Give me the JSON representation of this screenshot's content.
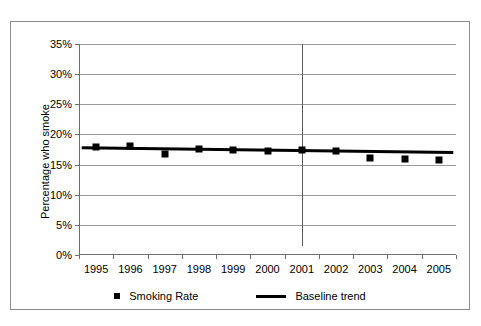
{
  "chart_data": {
    "type": "scatter",
    "title": "",
    "xlabel": "",
    "ylabel": "Percentage who smoke",
    "categories": [
      "1995",
      "1996",
      "1997",
      "1998",
      "1999",
      "2000",
      "2001",
      "2002",
      "2003",
      "2004",
      "2005"
    ],
    "ylim": [
      0,
      35
    ],
    "ytick_values": [
      0,
      5,
      10,
      15,
      20,
      25,
      30,
      35
    ],
    "ytick_labels": [
      "0%",
      "5%",
      "10%",
      "15%",
      "20%",
      "25%",
      "30%",
      "35%"
    ],
    "grid": true,
    "legend_position": "bottom",
    "series": [
      {
        "name": "Smoking Rate",
        "type": "scatter",
        "marker": "square",
        "color": "#000000",
        "values": [
          17.9,
          18.0,
          16.7,
          17.6,
          17.4,
          17.3,
          17.5,
          17.3,
          16.1,
          15.9,
          15.8
        ]
      },
      {
        "name": "Baseline trend",
        "type": "line",
        "color": "#000000",
        "start_value": 17.8,
        "end_value": 17.0,
        "values": [
          17.8,
          17.72,
          17.64,
          17.56,
          17.48,
          17.4,
          17.32,
          17.24,
          17.16,
          17.08,
          17.0
        ]
      }
    ],
    "annotations": [
      {
        "name": "intervention-line",
        "type": "vertical-line",
        "at_category": "2001",
        "y_from": 1.5,
        "y_to": 35,
        "color": "#5a5a5a"
      }
    ]
  },
  "legend": {
    "items": [
      {
        "label": "Smoking Rate",
        "marker": "square-marker"
      },
      {
        "label": "Baseline trend",
        "marker": "line-marker"
      }
    ]
  }
}
